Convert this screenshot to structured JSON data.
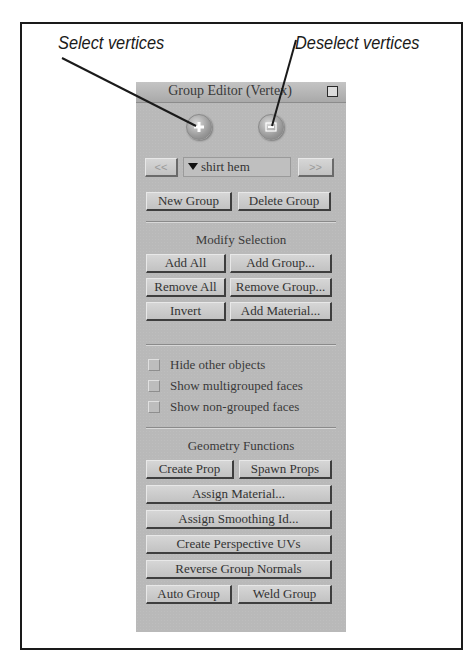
{
  "callouts": {
    "select": "Select vertices",
    "deselect": "Deselect vertices"
  },
  "panel": {
    "title": "Group Editor  (Vertex)",
    "icons": {
      "select": "select-vertices-icon",
      "deselect": "deselect-vertices-icon"
    },
    "nav": {
      "prev_label": "<<",
      "next_label": ">>",
      "group_selected": "shirt hem"
    },
    "group_buttons": {
      "new_group": "New Group",
      "delete_group": "Delete Group"
    },
    "modify_selection": {
      "heading": "Modify Selection",
      "add_all": "Add All",
      "add_group": "Add Group...",
      "remove_all": "Remove All",
      "remove_group": "Remove Group...",
      "invert": "Invert",
      "add_material": "Add Material..."
    },
    "options": {
      "hide_other_objects": "Hide other objects",
      "show_multigrouped_faces": "Show multigrouped faces",
      "show_non_grouped_faces": "Show non-grouped faces"
    },
    "geometry_functions": {
      "heading": "Geometry Functions",
      "create_prop": "Create Prop",
      "spawn_props": "Spawn Props",
      "assign_material": "Assign Material...",
      "assign_smoothing_id": "Assign Smoothing Id...",
      "create_perspective_uvs": "Create Perspective UVs",
      "reverse_group_normals": "Reverse Group Normals",
      "auto_group": "Auto Group",
      "weld_group": "Weld Group"
    }
  }
}
